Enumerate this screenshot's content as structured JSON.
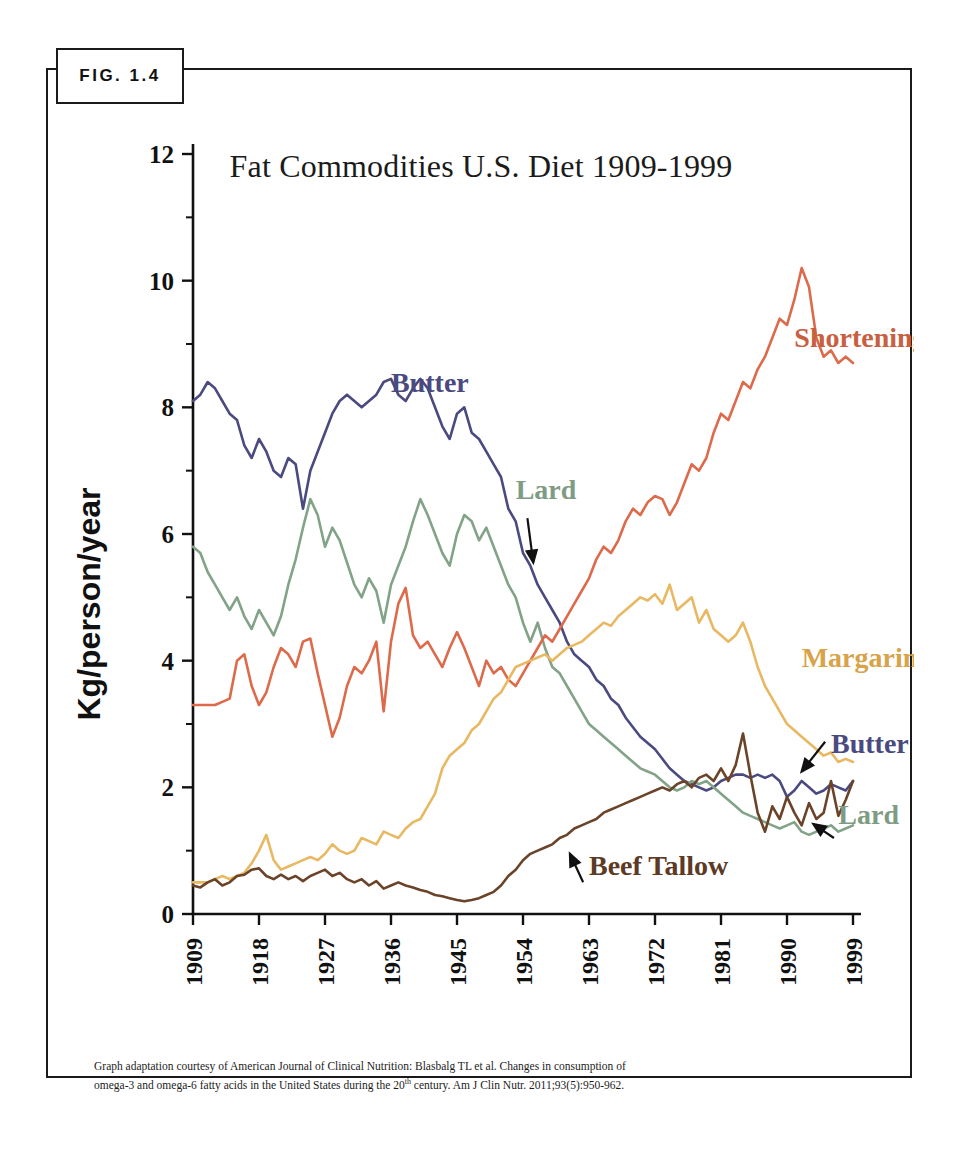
{
  "figure": {
    "tag_label": "FIG. 1.4",
    "footnote_line1": "Graph adaptation courtesy of American Journal of Clinical Nutrition: Blasbalg TL et al.  Changes in consumption of",
    "footnote_line2_a": "omega-3 and omega-6 fatty acids in the United States during the 20",
    "footnote_line2_sup": "th",
    "footnote_line2_b": " century. Am J Clin Nutr. 2011;93(5):950-962."
  },
  "chart_data": {
    "type": "line",
    "title": "Fat Commodities U.S. Diet 1909-1999",
    "xlabel": "Year",
    "ylabel": "Kg/person/year",
    "xlim": [
      1909,
      1999
    ],
    "ylim": [
      0,
      12
    ],
    "grid": false,
    "legend": "inline-annotations",
    "ytick_labels": [
      "0",
      "2",
      "4",
      "6",
      "8",
      "10",
      "12"
    ],
    "ytick_values": [
      0,
      2,
      4,
      6,
      8,
      10,
      12
    ],
    "yminor_values": [
      1,
      3,
      5,
      7,
      9,
      11
    ],
    "xtick_labels": [
      "1909",
      "1918",
      "1927",
      "1936",
      "1945",
      "1954",
      "1963",
      "1972",
      "1981",
      "1990",
      "1999"
    ],
    "xtick_values": [
      1909,
      1918,
      1927,
      1936,
      1945,
      1954,
      1963,
      1972,
      1981,
      1990,
      1999
    ],
    "colors": {
      "butter": "#4a4a80",
      "lard": "#82a387",
      "shortening": "#dd6a4a",
      "margarine": "#e8b862",
      "beef_tallow": "#6b4329"
    },
    "annotations": [
      {
        "name": "butter-label-left",
        "text": "Butter",
        "series": "butter",
        "x": 1936,
        "y": 8.25,
        "color": "#4a4a80",
        "arrow": false
      },
      {
        "name": "shortening-label",
        "text": "Shortening",
        "series": "shortening",
        "x": 1991,
        "y": 8.95,
        "color": "#c8603f",
        "arrow": false
      },
      {
        "name": "lard-label-left",
        "text": "Lard",
        "series": "lard",
        "x": 1953,
        "y": 6.55,
        "color": "#7e9c83",
        "arrow": true
      },
      {
        "name": "margarine-label",
        "text": "Margarine",
        "series": "margarine",
        "x": 1992,
        "y": 3.9,
        "color": "#d8a349",
        "arrow": false
      },
      {
        "name": "butter-label-right",
        "text": "Butter",
        "series": "butter",
        "x": 1996,
        "y": 2.55,
        "color": "#4a4a80",
        "arrow": true
      },
      {
        "name": "lard-label-right",
        "text": "Lard",
        "series": "lard",
        "x": 1997,
        "y": 1.42,
        "color": "#7e9c83",
        "arrow": true
      },
      {
        "name": "beef-tallow-label",
        "text": "Beef Tallow",
        "series": "beef_tallow",
        "x": 1963,
        "y": 0.62,
        "color": "#5c3a24",
        "arrow": true
      }
    ],
    "series": [
      {
        "name": "Butter",
        "key": "butter",
        "color": "#4a4a80",
        "x": [
          1909,
          1910,
          1911,
          1912,
          1913,
          1914,
          1915,
          1916,
          1917,
          1918,
          1919,
          1920,
          1921,
          1922,
          1923,
          1924,
          1925,
          1926,
          1927,
          1928,
          1929,
          1930,
          1931,
          1932,
          1933,
          1934,
          1935,
          1936,
          1937,
          1938,
          1939,
          1940,
          1941,
          1942,
          1943,
          1944,
          1945,
          1946,
          1947,
          1948,
          1949,
          1950,
          1951,
          1952,
          1953,
          1954,
          1955,
          1956,
          1957,
          1958,
          1959,
          1960,
          1961,
          1962,
          1963,
          1964,
          1965,
          1966,
          1967,
          1968,
          1969,
          1970,
          1971,
          1972,
          1973,
          1974,
          1975,
          1976,
          1977,
          1978,
          1979,
          1980,
          1981,
          1982,
          1983,
          1984,
          1985,
          1986,
          1987,
          1988,
          1989,
          1990,
          1991,
          1992,
          1993,
          1994,
          1995,
          1996,
          1997,
          1998,
          1999
        ],
        "y": [
          8.1,
          8.2,
          8.4,
          8.3,
          8.1,
          7.9,
          7.8,
          7.4,
          7.2,
          7.5,
          7.3,
          7.0,
          6.9,
          7.2,
          7.1,
          6.4,
          7.0,
          7.3,
          7.6,
          7.9,
          8.1,
          8.2,
          8.1,
          8.0,
          8.1,
          8.2,
          8.4,
          8.45,
          8.2,
          8.1,
          8.3,
          8.45,
          8.3,
          8.0,
          7.7,
          7.5,
          7.9,
          8.0,
          7.6,
          7.5,
          7.3,
          7.1,
          6.9,
          6.4,
          6.2,
          5.7,
          5.5,
          5.2,
          5.0,
          4.8,
          4.6,
          4.3,
          4.1,
          4.0,
          3.9,
          3.7,
          3.6,
          3.4,
          3.3,
          3.1,
          2.95,
          2.8,
          2.7,
          2.6,
          2.45,
          2.3,
          2.2,
          2.1,
          2.05,
          2.0,
          1.95,
          2.0,
          2.1,
          2.15,
          2.2,
          2.2,
          2.15,
          2.2,
          2.15,
          2.2,
          2.1,
          1.85,
          1.95,
          2.1,
          2.0,
          1.9,
          1.95,
          2.05,
          2.0,
          1.95,
          2.1
        ]
      },
      {
        "name": "Lard",
        "key": "lard",
        "color": "#82a387",
        "x": [
          1909,
          1910,
          1911,
          1912,
          1913,
          1914,
          1915,
          1916,
          1917,
          1918,
          1919,
          1920,
          1921,
          1922,
          1923,
          1924,
          1925,
          1926,
          1927,
          1928,
          1929,
          1930,
          1931,
          1932,
          1933,
          1934,
          1935,
          1936,
          1937,
          1938,
          1939,
          1940,
          1941,
          1942,
          1943,
          1944,
          1945,
          1946,
          1947,
          1948,
          1949,
          1950,
          1951,
          1952,
          1953,
          1954,
          1955,
          1956,
          1957,
          1958,
          1959,
          1960,
          1961,
          1962,
          1963,
          1964,
          1965,
          1966,
          1967,
          1968,
          1969,
          1970,
          1971,
          1972,
          1973,
          1974,
          1975,
          1976,
          1977,
          1978,
          1979,
          1980,
          1981,
          1982,
          1983,
          1984,
          1985,
          1986,
          1987,
          1988,
          1989,
          1990,
          1991,
          1992,
          1993,
          1994,
          1995,
          1996,
          1997,
          1998,
          1999
        ],
        "y": [
          5.8,
          5.7,
          5.4,
          5.2,
          5.0,
          4.8,
          5.0,
          4.7,
          4.5,
          4.8,
          4.6,
          4.4,
          4.7,
          5.2,
          5.6,
          6.1,
          6.55,
          6.3,
          5.8,
          6.1,
          5.9,
          5.55,
          5.2,
          5.0,
          5.3,
          5.1,
          4.6,
          5.2,
          5.5,
          5.8,
          6.2,
          6.55,
          6.3,
          6.0,
          5.7,
          5.5,
          6.0,
          6.3,
          6.2,
          5.9,
          6.1,
          5.8,
          5.5,
          5.2,
          5.0,
          4.6,
          4.3,
          4.6,
          4.2,
          3.9,
          3.8,
          3.6,
          3.4,
          3.2,
          3.0,
          2.9,
          2.8,
          2.7,
          2.6,
          2.5,
          2.4,
          2.3,
          2.25,
          2.2,
          2.1,
          2.0,
          1.95,
          2.0,
          2.1,
          2.05,
          2.1,
          2.0,
          1.9,
          1.8,
          1.7,
          1.6,
          1.55,
          1.5,
          1.45,
          1.4,
          1.35,
          1.4,
          1.45,
          1.3,
          1.25,
          1.3,
          1.35,
          1.4,
          1.3,
          1.35,
          1.4
        ]
      },
      {
        "name": "Shortening",
        "key": "shortening",
        "color": "#dd6a4a",
        "x": [
          1909,
          1910,
          1911,
          1912,
          1913,
          1914,
          1915,
          1916,
          1917,
          1918,
          1919,
          1920,
          1921,
          1922,
          1923,
          1924,
          1925,
          1926,
          1927,
          1928,
          1929,
          1930,
          1931,
          1932,
          1933,
          1934,
          1935,
          1936,
          1937,
          1938,
          1939,
          1940,
          1941,
          1942,
          1943,
          1944,
          1945,
          1946,
          1947,
          1948,
          1949,
          1950,
          1951,
          1952,
          1953,
          1954,
          1955,
          1956,
          1957,
          1958,
          1959,
          1960,
          1961,
          1962,
          1963,
          1964,
          1965,
          1966,
          1967,
          1968,
          1969,
          1970,
          1971,
          1972,
          1973,
          1974,
          1975,
          1976,
          1977,
          1978,
          1979,
          1980,
          1981,
          1982,
          1983,
          1984,
          1985,
          1986,
          1987,
          1988,
          1989,
          1990,
          1991,
          1992,
          1993,
          1994,
          1995,
          1996,
          1997,
          1998,
          1999
        ],
        "y": [
          3.3,
          3.3,
          3.3,
          3.3,
          3.35,
          3.4,
          4.0,
          4.1,
          3.6,
          3.3,
          3.5,
          3.9,
          4.2,
          4.1,
          3.9,
          4.3,
          4.35,
          3.8,
          3.3,
          2.8,
          3.1,
          3.6,
          3.9,
          3.8,
          4.0,
          4.3,
          3.2,
          4.3,
          4.9,
          5.15,
          4.4,
          4.2,
          4.3,
          4.1,
          3.9,
          4.2,
          4.45,
          4.2,
          3.9,
          3.6,
          4.0,
          3.8,
          3.9,
          3.7,
          3.6,
          3.8,
          4.0,
          4.2,
          4.4,
          4.3,
          4.5,
          4.7,
          4.9,
          5.1,
          5.3,
          5.6,
          5.8,
          5.7,
          5.9,
          6.2,
          6.4,
          6.3,
          6.5,
          6.6,
          6.55,
          6.3,
          6.5,
          6.8,
          7.1,
          7.0,
          7.2,
          7.6,
          7.9,
          7.8,
          8.1,
          8.4,
          8.3,
          8.6,
          8.8,
          9.1,
          9.4,
          9.3,
          9.7,
          10.2,
          9.9,
          9.1,
          8.8,
          8.9,
          8.7,
          8.8,
          8.7
        ]
      },
      {
        "name": "Margarine",
        "key": "margarine",
        "color": "#e8b862",
        "x": [
          1909,
          1910,
          1911,
          1912,
          1913,
          1914,
          1915,
          1916,
          1917,
          1918,
          1919,
          1920,
          1921,
          1922,
          1923,
          1924,
          1925,
          1926,
          1927,
          1928,
          1929,
          1930,
          1931,
          1932,
          1933,
          1934,
          1935,
          1936,
          1937,
          1938,
          1939,
          1940,
          1941,
          1942,
          1943,
          1944,
          1945,
          1946,
          1947,
          1948,
          1949,
          1950,
          1951,
          1952,
          1953,
          1954,
          1955,
          1956,
          1957,
          1958,
          1959,
          1960,
          1961,
          1962,
          1963,
          1964,
          1965,
          1966,
          1967,
          1968,
          1969,
          1970,
          1971,
          1972,
          1973,
          1974,
          1975,
          1976,
          1977,
          1978,
          1979,
          1980,
          1981,
          1982,
          1983,
          1984,
          1985,
          1986,
          1987,
          1988,
          1989,
          1990,
          1991,
          1992,
          1993,
          1994,
          1995,
          1996,
          1997,
          1998,
          1999
        ],
        "y": [
          0.5,
          0.5,
          0.5,
          0.55,
          0.6,
          0.55,
          0.6,
          0.65,
          0.8,
          1.0,
          1.25,
          0.85,
          0.7,
          0.75,
          0.8,
          0.85,
          0.9,
          0.85,
          0.95,
          1.1,
          1.0,
          0.95,
          1.0,
          1.2,
          1.15,
          1.1,
          1.3,
          1.25,
          1.2,
          1.35,
          1.45,
          1.5,
          1.7,
          1.9,
          2.3,
          2.5,
          2.6,
          2.7,
          2.9,
          3.0,
          3.2,
          3.4,
          3.5,
          3.7,
          3.9,
          3.95,
          4.0,
          4.05,
          4.1,
          4.0,
          4.1,
          4.2,
          4.25,
          4.3,
          4.4,
          4.5,
          4.6,
          4.55,
          4.7,
          4.8,
          4.9,
          5.0,
          4.95,
          5.05,
          4.9,
          5.2,
          4.8,
          4.9,
          5.0,
          4.6,
          4.8,
          4.5,
          4.4,
          4.3,
          4.4,
          4.6,
          4.3,
          3.9,
          3.6,
          3.4,
          3.2,
          3.0,
          2.9,
          2.8,
          2.7,
          2.6,
          2.5,
          2.55,
          2.4,
          2.45,
          2.4
        ]
      },
      {
        "name": "Beef Tallow",
        "key": "beef_tallow",
        "color": "#6b4329",
        "x": [
          1909,
          1910,
          1911,
          1912,
          1913,
          1914,
          1915,
          1916,
          1917,
          1918,
          1919,
          1920,
          1921,
          1922,
          1923,
          1924,
          1925,
          1926,
          1927,
          1928,
          1929,
          1930,
          1931,
          1932,
          1933,
          1934,
          1935,
          1936,
          1937,
          1938,
          1939,
          1940,
          1941,
          1942,
          1943,
          1944,
          1945,
          1946,
          1947,
          1948,
          1949,
          1950,
          1951,
          1952,
          1953,
          1954,
          1955,
          1956,
          1957,
          1958,
          1959,
          1960,
          1961,
          1962,
          1963,
          1964,
          1965,
          1966,
          1967,
          1968,
          1969,
          1970,
          1971,
          1972,
          1973,
          1974,
          1975,
          1976,
          1977,
          1978,
          1979,
          1980,
          1981,
          1982,
          1983,
          1984,
          1985,
          1986,
          1987,
          1988,
          1989,
          1990,
          1991,
          1992,
          1993,
          1994,
          1995,
          1996,
          1997,
          1998,
          1999
        ],
        "y": [
          0.45,
          0.42,
          0.5,
          0.55,
          0.45,
          0.5,
          0.6,
          0.62,
          0.7,
          0.72,
          0.6,
          0.55,
          0.62,
          0.55,
          0.6,
          0.52,
          0.6,
          0.65,
          0.7,
          0.6,
          0.65,
          0.55,
          0.5,
          0.55,
          0.45,
          0.52,
          0.4,
          0.45,
          0.5,
          0.45,
          0.42,
          0.38,
          0.35,
          0.3,
          0.28,
          0.25,
          0.22,
          0.2,
          0.22,
          0.25,
          0.3,
          0.35,
          0.45,
          0.6,
          0.7,
          0.85,
          0.95,
          1.0,
          1.05,
          1.1,
          1.2,
          1.25,
          1.35,
          1.4,
          1.45,
          1.5,
          1.6,
          1.65,
          1.7,
          1.75,
          1.8,
          1.85,
          1.9,
          1.95,
          2.0,
          1.95,
          2.05,
          2.1,
          2.0,
          2.15,
          2.2,
          2.1,
          2.3,
          2.1,
          2.35,
          2.85,
          2.2,
          1.6,
          1.3,
          1.7,
          1.5,
          1.85,
          1.6,
          1.4,
          1.75,
          1.5,
          1.6,
          2.1,
          1.55,
          1.8,
          2.1
        ]
      }
    ]
  }
}
